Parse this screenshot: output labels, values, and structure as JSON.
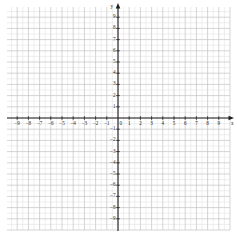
{
  "chart_data": {
    "type": "grid",
    "title": "",
    "xlabel": "x",
    "ylabel": "y",
    "xlim": [
      -10,
      10
    ],
    "ylim": [
      -10,
      10
    ],
    "grid": true,
    "minor_grid": true,
    "minor_per_unit": 2,
    "series": [],
    "x_ticks": [
      -9,
      -8,
      -7,
      -6,
      -5,
      -4,
      -3,
      -2,
      -1,
      1,
      2,
      3,
      4,
      5,
      6,
      7,
      8,
      9
    ],
    "y_ticks": [
      9,
      8,
      7,
      6,
      5,
      4,
      3,
      2,
      1,
      -1,
      -2,
      -3,
      -4,
      -5,
      -6,
      -7,
      -8,
      -9
    ],
    "x_tick_labels": [
      "−9",
      "−8",
      "−7",
      "−6",
      "−5",
      "−4",
      "−3",
      "−2",
      "−1",
      "1",
      "2",
      "3",
      "4",
      "5",
      "6",
      "7",
      "8",
      "9"
    ],
    "y_tick_labels": [
      "9",
      "8",
      "7",
      "6",
      "5",
      "4",
      "3",
      "2",
      "1",
      "−1",
      "−2",
      "−3",
      "−4",
      "−5",
      "−6",
      "−7",
      "−8",
      "−9"
    ],
    "origin_label": "0",
    "axis_labels": {
      "x": "x",
      "y": "y"
    },
    "colors": {
      "background": "#ffffff",
      "axis": "#231f20",
      "major_grid": "#b9b9bb",
      "minor_grid": "#dcdcde",
      "tick_text": "#2b2b2b"
    },
    "arrowheads": {
      "x_positive": true,
      "y_positive": true
    }
  },
  "axes": {
    "x_name": "x",
    "y_name": "y",
    "origin": "0"
  }
}
